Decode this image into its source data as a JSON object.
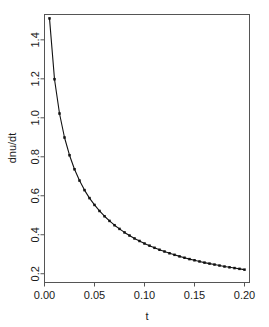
{
  "chart_data": {
    "type": "line",
    "title": "",
    "subtitle": "",
    "xlabel": "t",
    "ylabel": "dnu/dt",
    "xlim": [
      0.0,
      0.205
    ],
    "ylim": [
      0.155,
      1.53
    ],
    "grid": false,
    "legend": null,
    "markers": "filled-square-points",
    "xticks": [
      0.0,
      0.05,
      0.1,
      0.15,
      0.2
    ],
    "xtick_labels": [
      "0.00",
      "0.05",
      "0.10",
      "0.15",
      "0.20"
    ],
    "yticks": [
      0.2,
      0.4,
      0.6,
      0.8,
      1.0,
      1.2,
      1.4
    ],
    "ytick_labels": [
      "0.2",
      "0.4",
      "0.6",
      "0.8",
      "1.0",
      "1.2",
      "1.4"
    ],
    "series": [
      {
        "name": "dnu/dt",
        "x": [
          0.005,
          0.01,
          0.015,
          0.02,
          0.025,
          0.03,
          0.035,
          0.04,
          0.045,
          0.05,
          0.055,
          0.06,
          0.065,
          0.07,
          0.075,
          0.08,
          0.085,
          0.09,
          0.095,
          0.1,
          0.105,
          0.11,
          0.115,
          0.12,
          0.125,
          0.13,
          0.135,
          0.14,
          0.145,
          0.15,
          0.155,
          0.16,
          0.165,
          0.17,
          0.175,
          0.18,
          0.185,
          0.19,
          0.195,
          0.2
        ],
        "values": [
          1.51,
          1.198,
          1.022,
          0.899,
          0.808,
          0.736,
          0.678,
          0.629,
          0.588,
          0.553,
          0.522,
          0.495,
          0.471,
          0.449,
          0.43,
          0.412,
          0.396,
          0.381,
          0.368,
          0.355,
          0.344,
          0.333,
          0.323,
          0.314,
          0.305,
          0.297,
          0.289,
          0.282,
          0.275,
          0.269,
          0.263,
          0.257,
          0.252,
          0.247,
          0.242,
          0.237,
          0.233,
          0.229,
          0.225,
          0.221
        ]
      }
    ]
  },
  "colors": {
    "curve": "#111111",
    "point": "#111111",
    "axis": "#555555",
    "text": "#1a1a1a",
    "background": "#ffffff"
  }
}
